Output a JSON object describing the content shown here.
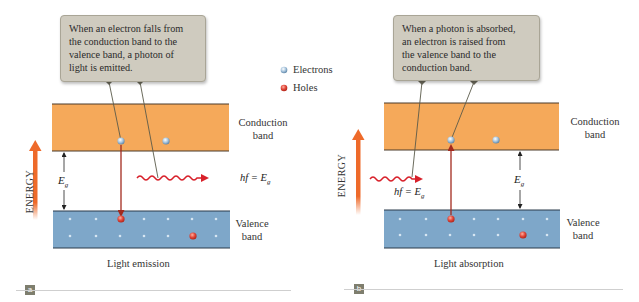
{
  "legend": {
    "electrons_label": "Electrons",
    "holes_label": "Holes"
  },
  "panel_a": {
    "badge": "a",
    "caption": "Light emission",
    "callout_lines": [
      "When an electron falls from",
      "the conduction band to the",
      "valence band, a photon of",
      "light is emitted."
    ],
    "conduction_label": [
      "Conduction",
      "band"
    ],
    "valence_label": [
      "Valence",
      "band"
    ],
    "energy_label": "ENERGY",
    "gap_label": "E",
    "gap_sub": "g",
    "photon_label": "hf = E",
    "photon_sub": "g"
  },
  "panel_b": {
    "badge": "b",
    "caption": "Light absorption",
    "callout_lines": [
      "When a photon is absorbed,",
      "an electron is raised from",
      "the valence band to the",
      "conduction band."
    ],
    "conduction_label": [
      "Conduction",
      "band"
    ],
    "valence_label": [
      "Valence",
      "band"
    ],
    "energy_label": "ENERGY",
    "gap_label": "E",
    "gap_sub": "g",
    "photon_label": "hf = E",
    "photon_sub": "g"
  },
  "colors": {
    "conduction_band": "#f5a95a",
    "valence_band": "#7ea7c9",
    "electron": "#a9c6de",
    "hole": "#e0473a",
    "energy_arrow": "#ee6a2a",
    "photon": "#d8202a",
    "transition_arrow": "#a32a1e",
    "callout_bg": "#cfcbbf"
  }
}
